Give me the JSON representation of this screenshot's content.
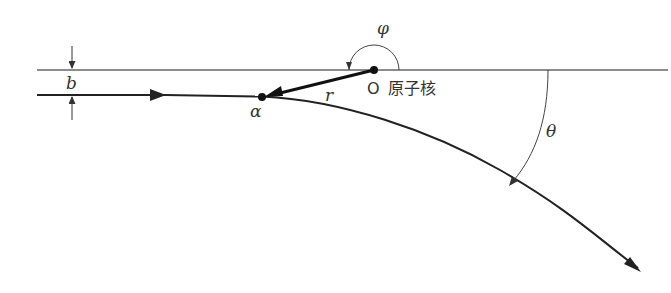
{
  "diagram": {
    "type": "rutherford-scattering",
    "labels": {
      "impact_parameter": "b",
      "azimuth_angle": "φ",
      "distance": "r",
      "origin": "O",
      "nucleus": "原子核",
      "alpha_particle": "α",
      "scattering_angle": "θ"
    },
    "colors": {
      "line": "#555555",
      "path": "#222222",
      "point": "#111111"
    }
  }
}
